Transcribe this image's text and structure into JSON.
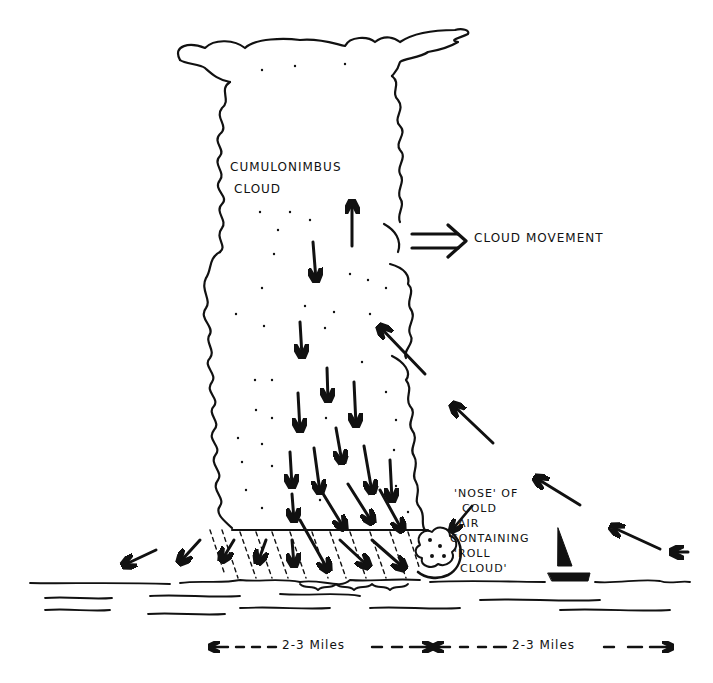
{
  "diagram": {
    "labels": {
      "cloud_line1": "Cumulonimbus",
      "cloud_line2": "Cloud",
      "movement": "Cloud Movement",
      "nose_line1": "'Nose' of",
      "nose_line2": "Cold",
      "nose_line3": "Air",
      "nose_line4": "Containing",
      "nose_line5": "'Roll",
      "nose_line6": "Cloud'"
    },
    "scale": {
      "left_span": "2-3 Miles",
      "right_span": "2-3 Miles"
    },
    "elements": {
      "cloud": "cumulonimbus anvil cloud column",
      "downdraft_arrows": "downward air arrows inside cloud",
      "updraft_arrow": "upward arrow inside cloud",
      "inflow_arrows": "arrows flowing into cloud from right",
      "outflow_arrows": "arrows flowing out at lower left",
      "rain": "dashed rain shafts below cloud base",
      "roll_cloud": "roll cloud at leading edge",
      "boat": "small sailboat",
      "water": "wavy water surface lines"
    },
    "colors": {
      "ink": "#111111",
      "paper": "#ffffff"
    }
  }
}
